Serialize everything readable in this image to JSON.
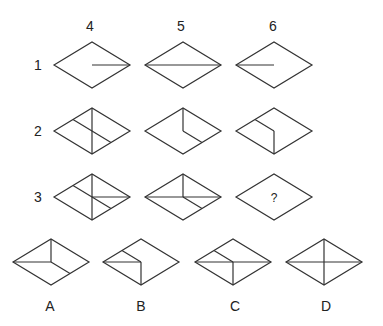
{
  "puzzle": {
    "column_headers": [
      {
        "label": "4",
        "x": 90,
        "y": 26
      },
      {
        "label": "5",
        "x": 181,
        "y": 26
      },
      {
        "label": "6",
        "x": 273,
        "y": 26
      }
    ],
    "row_labels": [
      {
        "label": "1",
        "x": 38,
        "y": 65
      },
      {
        "label": "2",
        "x": 38,
        "y": 131
      },
      {
        "label": "3",
        "x": 38,
        "y": 197
      }
    ],
    "question_mark": "?",
    "stroke_color": "#333333",
    "diamond_half_width": 38,
    "diamond_half_height": 23,
    "grid": [
      {
        "id": "r1c4",
        "cx": 92,
        "cy": 65,
        "segments": [
          [
            "C",
            "R"
          ]
        ]
      },
      {
        "id": "r1c5",
        "cx": 183,
        "cy": 65,
        "segments": [
          [
            "L",
            "R"
          ]
        ]
      },
      {
        "id": "r1c6",
        "cx": 274,
        "cy": 65,
        "segments": [
          [
            "L",
            "C"
          ]
        ]
      },
      {
        "id": "r2c4",
        "cx": 92,
        "cy": 131,
        "segments": [
          [
            "T",
            "B"
          ],
          [
            "ULm",
            "LRm"
          ]
        ]
      },
      {
        "id": "r2c5",
        "cx": 183,
        "cy": 131,
        "segments": [
          [
            "T",
            "C"
          ],
          [
            "C",
            "LRm"
          ]
        ]
      },
      {
        "id": "r2c6",
        "cx": 274,
        "cy": 131,
        "segments": [
          [
            "ULm",
            "C"
          ],
          [
            "C",
            "B"
          ]
        ]
      },
      {
        "id": "r3c4",
        "cx": 92,
        "cy": 197,
        "segments": [
          [
            "T",
            "B"
          ],
          [
            "ULm",
            "LRm"
          ],
          [
            "C",
            "R"
          ]
        ]
      },
      {
        "id": "r3c5",
        "cx": 183,
        "cy": 197,
        "segments": [
          [
            "L",
            "R"
          ],
          [
            "T",
            "C"
          ],
          [
            "C",
            "LRm"
          ]
        ]
      },
      {
        "id": "r3c6",
        "cx": 274,
        "cy": 197,
        "segments": [],
        "question": true
      }
    ],
    "options": [
      {
        "label": "A",
        "cx": 51,
        "cy": 262,
        "label_x": 50,
        "label_y": 306,
        "segments": [
          [
            "L",
            "C"
          ],
          [
            "T",
            "C"
          ],
          [
            "C",
            "LRm"
          ]
        ]
      },
      {
        "label": "B",
        "cx": 141,
        "cy": 262,
        "label_x": 141,
        "label_y": 306,
        "segments": [
          [
            "L",
            "C"
          ],
          [
            "ULm",
            "C"
          ],
          [
            "C",
            "B"
          ]
        ]
      },
      {
        "label": "C",
        "cx": 233,
        "cy": 262,
        "label_x": 235,
        "label_y": 306,
        "segments": [
          [
            "L",
            "R"
          ],
          [
            "ULm",
            "C"
          ],
          [
            "C",
            "B"
          ]
        ]
      },
      {
        "label": "D",
        "cx": 324,
        "cy": 262,
        "label_x": 326,
        "label_y": 306,
        "segments": [
          [
            "L",
            "R"
          ],
          [
            "T",
            "B"
          ]
        ]
      }
    ]
  }
}
